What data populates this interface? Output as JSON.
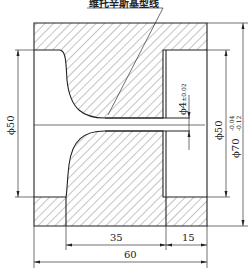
{
  "drawing": {
    "title_label": "维托辛斯基型线",
    "dimensions": {
      "left_diameter": "ϕ50",
      "throat_diameter_symbol": "ϕ",
      "throat_diameter_value": "4",
      "throat_tolerance": "±0.02",
      "right_diameter": "ϕ50",
      "outer_diameter_symbol": "ϕ",
      "outer_diameter_value": "70",
      "outer_tol_upper": "-0.04",
      "outer_tol_lower": "-0.12",
      "length_converging": "35",
      "length_straight": "15",
      "length_total": "60"
    },
    "colors": {
      "line": "#222222",
      "hatch": "#555555",
      "background": "#ffffff"
    }
  }
}
